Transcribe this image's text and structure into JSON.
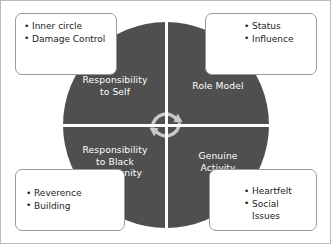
{
  "diagram": {
    "type": "four-quadrant-cycle",
    "colors": {
      "quadrant_fill": "#4f4f4f",
      "quadrant_text": "#ffffff",
      "divider": "#ffffff",
      "callout_border": "#9a9a9a",
      "callout_text": "#1d1d1d",
      "page_border": "#b9b9b9",
      "center_icon": "#c9c9c9"
    },
    "center_icon": "cycle-arrows-icon",
    "quadrants": [
      {
        "id": "top-left",
        "label": "Responsibility\nto Self"
      },
      {
        "id": "top-right",
        "label": "Role Model"
      },
      {
        "id": "bottom-left",
        "label": "Responsibility\nto Black\nCommunity"
      },
      {
        "id": "bottom-right",
        "label": "Genuine\nActivity"
      }
    ],
    "callouts": [
      {
        "id": "top-left",
        "linked_quadrant": "Responsibility to Self",
        "items": [
          "Inner circle",
          "Damage Control"
        ]
      },
      {
        "id": "top-right",
        "linked_quadrant": "Role Model",
        "items": [
          "Status",
          "Influence"
        ]
      },
      {
        "id": "bottom-left",
        "linked_quadrant": "Responsibility to Black Community",
        "items": [
          "Reverence",
          "Building"
        ]
      },
      {
        "id": "bottom-right",
        "linked_quadrant": "Genuine Activity",
        "items": [
          "Heartfelt",
          "Social Issues"
        ]
      }
    ]
  }
}
